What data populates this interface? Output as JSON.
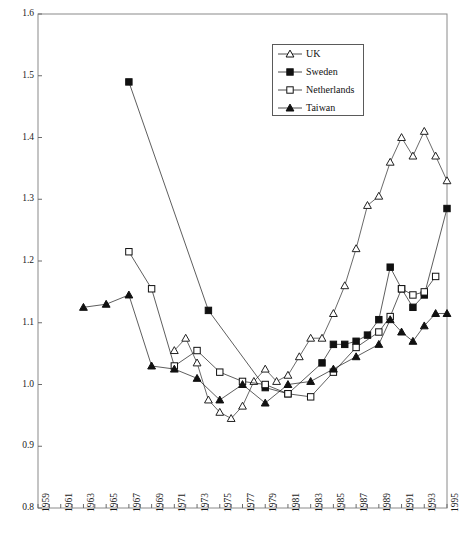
{
  "chart_data": {
    "type": "line",
    "title": "",
    "xlabel": "",
    "ylabel": "",
    "xlim": [
      1959,
      1995
    ],
    "ylim": [
      0.8,
      1.6
    ],
    "ytick_labels": [
      "0.8",
      "0.9",
      "1.0",
      "1.1",
      "1.2",
      "1.3",
      "1.4",
      "1.5",
      "1.6"
    ],
    "ytick_values": [
      0.8,
      0.9,
      1.0,
      1.1,
      1.2,
      1.3,
      1.4,
      1.5,
      1.6
    ],
    "xtick_values": [
      1959,
      1960,
      1961,
      1962,
      1963,
      1964,
      1965,
      1966,
      1967,
      1968,
      1969,
      1970,
      1971,
      1972,
      1973,
      1974,
      1975,
      1976,
      1977,
      1978,
      1979,
      1980,
      1981,
      1982,
      1983,
      1984,
      1985,
      1986,
      1987,
      1988,
      1989,
      1990,
      1991,
      1992,
      1993,
      1994,
      1995
    ],
    "xtick_labels": [
      "1959",
      "1961",
      "1963",
      "1965",
      "1967",
      "1969",
      "1971",
      "1973",
      "1975",
      "1977",
      "1979",
      "1981",
      "1983",
      "1985",
      "1987",
      "1989",
      "1991",
      "1993",
      "1995"
    ],
    "xtick_label_values": [
      1959,
      1961,
      1963,
      1965,
      1967,
      1969,
      1971,
      1973,
      1975,
      1977,
      1979,
      1981,
      1983,
      1985,
      1987,
      1989,
      1991,
      1993,
      1995
    ],
    "grid": false,
    "legend_position": "top-center",
    "series": [
      {
        "name": "UK",
        "marker": "open-triangle",
        "color": "#222222",
        "x": [
          1971,
          1972,
          1973,
          1974,
          1975,
          1976,
          1977,
          1978,
          1979,
          1980,
          1981,
          1982,
          1983,
          1984,
          1985,
          1986,
          1987,
          1988,
          1989,
          1990,
          1991,
          1992,
          1993,
          1994,
          1995
        ],
        "y": [
          1.055,
          1.075,
          1.035,
          0.975,
          0.955,
          0.945,
          0.965,
          1.005,
          1.025,
          1.005,
          1.015,
          1.045,
          1.075,
          1.075,
          1.115,
          1.16,
          1.22,
          1.29,
          1.305,
          1.36,
          1.4,
          1.37,
          1.41,
          1.37,
          1.33
        ]
      },
      {
        "name": "Sweden",
        "marker": "filled-square",
        "color": "#111111",
        "x": [
          1967,
          1974,
          1979,
          1981,
          1984,
          1985,
          1986,
          1987,
          1988,
          1989,
          1990,
          1991,
          1992,
          1993,
          1995
        ],
        "y": [
          1.49,
          1.12,
          0.995,
          0.985,
          1.035,
          1.065,
          1.065,
          1.07,
          1.08,
          1.105,
          1.19,
          1.155,
          1.125,
          1.145,
          1.285
        ]
      },
      {
        "name": "Netherlands",
        "marker": "open-square",
        "color": "#111111",
        "x": [
          1967,
          1969,
          1971,
          1973,
          1975,
          1977,
          1979,
          1981,
          1983,
          1985,
          1987,
          1989,
          1990,
          1991,
          1992,
          1993,
          1994
        ],
        "y": [
          1.215,
          1.155,
          1.03,
          1.055,
          1.02,
          1.005,
          1.0,
          0.985,
          0.98,
          1.02,
          1.06,
          1.085,
          1.11,
          1.155,
          1.145,
          1.15,
          1.175
        ]
      },
      {
        "name": "Taiwan",
        "marker": "filled-triangle",
        "color": "#111111",
        "x": [
          1963,
          1965,
          1967,
          1969,
          1971,
          1973,
          1975,
          1977,
          1979,
          1981,
          1983,
          1985,
          1987,
          1989,
          1990,
          1991,
          1992,
          1993,
          1994,
          1995
        ],
        "y": [
          1.125,
          1.13,
          1.145,
          1.03,
          1.025,
          1.01,
          0.975,
          1.0,
          0.97,
          1.0,
          1.005,
          1.025,
          1.045,
          1.065,
          1.105,
          1.085,
          1.07,
          1.095,
          1.115,
          1.115
        ]
      }
    ],
    "legend": [
      {
        "label": "UK",
        "marker": "open-triangle"
      },
      {
        "label": "Sweden",
        "marker": "filled-square"
      },
      {
        "label": "Netherlands",
        "marker": "open-square"
      },
      {
        "label": "Taiwan",
        "marker": "filled-triangle"
      }
    ]
  }
}
